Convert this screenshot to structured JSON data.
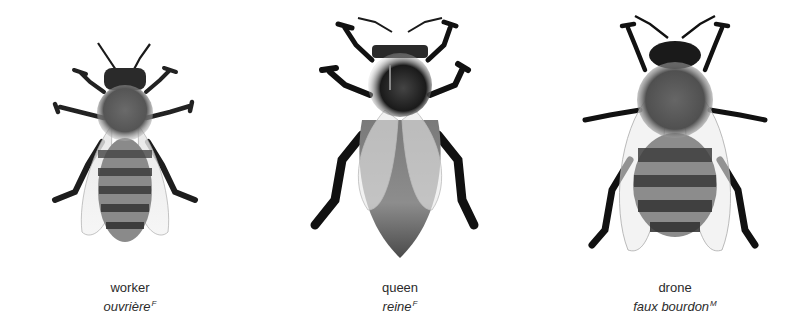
{
  "illustration": {
    "bees": [
      {
        "id": "worker",
        "label": "worker",
        "translation": "ouvrière",
        "gender": "F"
      },
      {
        "id": "queen",
        "label": "queen",
        "translation": "reine",
        "gender": "F"
      },
      {
        "id": "drone",
        "label": "drone",
        "translation": "faux bourdon",
        "gender": "M"
      }
    ]
  }
}
